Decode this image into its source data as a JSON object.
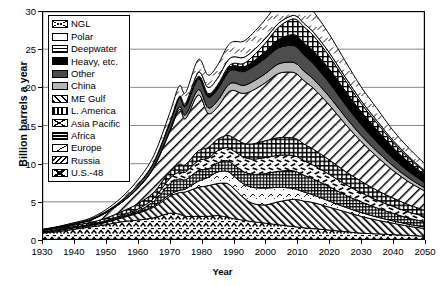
{
  "chart_data": {
    "type": "area",
    "title": "",
    "xlabel": "Year",
    "ylabel": "Billion barrels a year",
    "xlim": [
      1930,
      2050
    ],
    "ylim": [
      0,
      30
    ],
    "ytick_labels": [
      "0",
      "5",
      "10",
      "15",
      "20",
      "25",
      "30"
    ],
    "ytick_values": [
      0,
      5,
      10,
      15,
      20,
      25,
      30
    ],
    "xtick_labels": [
      "1930",
      "1940",
      "1950",
      "1960",
      "1970",
      "1980",
      "1990",
      "2000",
      "2010",
      "2020",
      "2030",
      "2040",
      "2050"
    ],
    "xtick_values": [
      1930,
      1940,
      1950,
      1960,
      1970,
      1980,
      1990,
      2000,
      2010,
      2020,
      2030,
      2040,
      2050
    ],
    "grid": true,
    "legend_position": "upper-left-inside",
    "stacked": true,
    "stack_order_bottom_to_top": [
      "U.S.-48",
      "Russia",
      "Europe",
      "Africa",
      "Asia Pacific",
      "L. America",
      "ME Gulf",
      "China",
      "Other",
      "Heavy, etc.",
      "Deepwater",
      "Polar",
      "NGL"
    ],
    "x": [
      1930,
      1935,
      1940,
      1945,
      1950,
      1955,
      1960,
      1965,
      1970,
      1973,
      1975,
      1979,
      1982,
      1985,
      1988,
      1990,
      1993,
      1996,
      2000,
      2004,
      2008,
      2010,
      2012,
      2015,
      2020,
      2025,
      2030,
      2035,
      2040,
      2045,
      2050
    ],
    "series": [
      {
        "name": "U.S.-48",
        "values": [
          0.9,
          1.1,
          1.4,
          1.7,
          2.0,
          2.4,
          2.6,
          2.9,
          3.5,
          3.4,
          3.1,
          3.1,
          3.1,
          3.2,
          3.0,
          2.8,
          2.6,
          2.4,
          2.2,
          2.0,
          1.8,
          1.7,
          1.6,
          1.5,
          1.3,
          1.1,
          0.9,
          0.8,
          0.7,
          0.6,
          0.5
        ]
      },
      {
        "name": "Russia",
        "values": [
          0.1,
          0.15,
          0.2,
          0.2,
          0.3,
          0.5,
          0.9,
          1.4,
          2.2,
          2.8,
          3.2,
          3.8,
          4.0,
          4.2,
          4.4,
          4.0,
          3.0,
          2.4,
          2.4,
          3.0,
          3.5,
          3.6,
          3.5,
          3.4,
          3.0,
          2.6,
          2.2,
          1.8,
          1.5,
          1.2,
          1.0
        ]
      },
      {
        "name": "Europe",
        "values": [
          0.02,
          0.02,
          0.03,
          0.03,
          0.05,
          0.08,
          0.1,
          0.15,
          0.25,
          0.3,
          0.4,
          0.8,
          1.1,
          1.5,
          1.6,
          1.6,
          1.8,
          2.1,
          2.2,
          1.9,
          1.5,
          1.3,
          1.2,
          1.0,
          0.8,
          0.6,
          0.5,
          0.4,
          0.3,
          0.25,
          0.2
        ]
      },
      {
        "name": "Africa",
        "values": [
          0.02,
          0.03,
          0.03,
          0.04,
          0.06,
          0.1,
          0.2,
          0.6,
          1.4,
          1.5,
          1.2,
          1.4,
          1.1,
          1.2,
          1.4,
          1.5,
          1.6,
          1.7,
          1.9,
          2.1,
          2.3,
          2.3,
          2.2,
          2.1,
          1.9,
          1.6,
          1.4,
          1.2,
          1.0,
          0.8,
          0.7
        ]
      },
      {
        "name": "Asia Pacific",
        "values": [
          0.05,
          0.06,
          0.08,
          0.06,
          0.1,
          0.15,
          0.25,
          0.4,
          0.7,
          0.9,
          1.0,
          1.3,
          1.4,
          1.6,
          1.7,
          1.8,
          1.9,
          2.0,
          2.1,
          2.1,
          2.0,
          2.0,
          1.9,
          1.8,
          1.6,
          1.4,
          1.2,
          1.0,
          0.9,
          0.8,
          0.7
        ]
      },
      {
        "name": "L. America",
        "values": [
          0.15,
          0.18,
          0.2,
          0.25,
          0.35,
          0.5,
          0.7,
          0.8,
          0.9,
          1.0,
          1.0,
          1.3,
          1.4,
          1.5,
          1.6,
          1.7,
          1.8,
          2.0,
          2.2,
          2.3,
          2.3,
          2.3,
          2.2,
          2.1,
          1.9,
          1.7,
          1.5,
          1.3,
          1.1,
          0.95,
          0.8
        ]
      },
      {
        "name": "ME Gulf",
        "values": [
          0.05,
          0.1,
          0.15,
          0.3,
          0.7,
          1.2,
          2.0,
          3.2,
          5.2,
          7.2,
          6.0,
          7.3,
          4.5,
          4.2,
          5.5,
          6.2,
          6.5,
          7.0,
          7.6,
          8.4,
          8.6,
          8.5,
          8.3,
          8.0,
          7.2,
          6.2,
          5.2,
          4.4,
          3.6,
          3.0,
          2.5
        ]
      },
      {
        "name": "China",
        "values": [
          0.0,
          0.0,
          0.0,
          0.0,
          0.01,
          0.03,
          0.08,
          0.1,
          0.2,
          0.35,
          0.5,
          0.7,
          0.75,
          0.85,
          0.95,
          1.0,
          1.05,
          1.15,
          1.2,
          1.25,
          1.3,
          1.3,
          1.25,
          1.2,
          1.1,
          0.95,
          0.8,
          0.7,
          0.6,
          0.5,
          0.4
        ]
      },
      {
        "name": "Other",
        "values": [
          0.05,
          0.06,
          0.08,
          0.1,
          0.15,
          0.25,
          0.4,
          0.6,
          0.9,
          1.1,
          1.1,
          1.4,
          1.4,
          1.5,
          1.6,
          1.7,
          1.8,
          1.9,
          2.0,
          2.1,
          2.2,
          2.2,
          2.1,
          2.0,
          1.8,
          1.6,
          1.4,
          1.2,
          1.0,
          0.85,
          0.7
        ]
      },
      {
        "name": "Heavy, etc.",
        "values": [
          0.0,
          0.0,
          0.0,
          0.0,
          0.0,
          0.0,
          0.02,
          0.05,
          0.1,
          0.15,
          0.2,
          0.3,
          0.35,
          0.4,
          0.5,
          0.55,
          0.6,
          0.7,
          0.9,
          1.1,
          1.4,
          1.5,
          1.6,
          1.7,
          1.8,
          1.8,
          1.7,
          1.6,
          1.4,
          1.2,
          1.0
        ]
      },
      {
        "name": "Deepwater",
        "values": [
          0.0,
          0.0,
          0.0,
          0.0,
          0.0,
          0.0,
          0.0,
          0.0,
          0.0,
          0.0,
          0.02,
          0.05,
          0.1,
          0.15,
          0.25,
          0.3,
          0.45,
          0.7,
          1.1,
          1.6,
          2.0,
          2.1,
          2.1,
          2.0,
          1.7,
          1.4,
          1.1,
          0.9,
          0.7,
          0.55,
          0.4
        ]
      },
      {
        "name": "Polar",
        "values": [
          0.0,
          0.0,
          0.0,
          0.0,
          0.0,
          0.0,
          0.0,
          0.0,
          0.05,
          0.1,
          0.2,
          0.5,
          0.8,
          0.9,
          0.9,
          0.85,
          0.8,
          0.7,
          0.6,
          0.5,
          0.45,
          0.45,
          0.45,
          0.45,
          0.45,
          0.4,
          0.35,
          0.3,
          0.25,
          0.2,
          0.15
        ]
      },
      {
        "name": "NGL",
        "values": [
          0.05,
          0.07,
          0.1,
          0.15,
          0.25,
          0.4,
          0.6,
          0.85,
          1.2,
          1.4,
          1.4,
          1.7,
          1.6,
          1.7,
          1.9,
          2.0,
          2.1,
          2.3,
          2.5,
          2.7,
          2.9,
          2.9,
          2.8,
          2.7,
          2.4,
          2.1,
          1.8,
          1.6,
          1.3,
          1.1,
          0.9
        ]
      }
    ],
    "peak": {
      "year": 2008,
      "value": 30.0
    }
  },
  "axes": {
    "y_title": "Billion barrels a year",
    "x_title": "Year",
    "y_ticks": [
      "30",
      "25",
      "20",
      "15",
      "10",
      "5",
      "0"
    ],
    "x_ticks": [
      "1930",
      "1940",
      "1950",
      "1960",
      "1970",
      "1980",
      "1990",
      "2000",
      "2010",
      "2020",
      "2030",
      "2040",
      "2050"
    ]
  },
  "legend": {
    "items": [
      {
        "label": "NGL",
        "pattern": "p-ngl"
      },
      {
        "label": "Polar",
        "pattern": "p-polar"
      },
      {
        "label": "Deepwater",
        "pattern": "p-deep"
      },
      {
        "label": "Heavy, etc.",
        "pattern": "p-heavy"
      },
      {
        "label": "Other",
        "pattern": "p-other"
      },
      {
        "label": "China",
        "pattern": "p-china"
      },
      {
        "label": "ME Gulf",
        "pattern": "p-megulf"
      },
      {
        "label": "L. America",
        "pattern": "p-lamer"
      },
      {
        "label": "Asia Pacific",
        "pattern": "p-asia"
      },
      {
        "label": "Africa",
        "pattern": "p-africa"
      },
      {
        "label": "Europe",
        "pattern": "p-europe"
      },
      {
        "label": "Russia",
        "pattern": "p-russia"
      },
      {
        "label": "U.S.-48",
        "pattern": "p-us48"
      }
    ]
  },
  "caption": ""
}
